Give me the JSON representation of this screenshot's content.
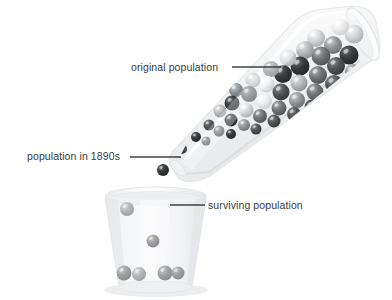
{
  "figure": {
    "kind": "illustration",
    "background_color": "#ffffff",
    "label_color": "#3a3a3c",
    "leader_line_color": "#3f3f41"
  },
  "labels": {
    "original_population": "original population",
    "population_1890s": "population in 1890s",
    "surviving_population": "surviving population"
  },
  "leaders": [
    {
      "name": "leader-original-population",
      "x1": 232,
      "y1": 67,
      "x2": 281,
      "y2": 67
    },
    {
      "name": "leader-population-1890s",
      "x1": 130,
      "y1": 157,
      "x2": 181,
      "y2": 157
    },
    {
      "name": "leader-surviving-population",
      "x1": 170,
      "y1": 205,
      "x2": 205,
      "y2": 205
    }
  ],
  "tube": {
    "name": "tilted-test-tube",
    "fill": "#f4f5f6",
    "stroke": "#e2e4e6",
    "rim_highlight": "#ffffff"
  },
  "cup": {
    "name": "beaker-cup",
    "fill": "#f3f4f5",
    "stroke": "#e6e8ea",
    "rim": "#fafbfb"
  },
  "marble_palette": {
    "very_light": "#e8e9ea",
    "light": "#cdcfd1",
    "mid_light": "#aeb1b4",
    "mid": "#8d9093",
    "mid_dark": "#6e7174",
    "dark": "#4d5053",
    "very_dark": "#34373a"
  },
  "marbles_in_tube": [
    {
      "cx": 354,
      "cy": 34,
      "r": 9.5,
      "tone": "light"
    },
    {
      "cx": 340,
      "cy": 27,
      "r": 8.5,
      "tone": "very_light"
    },
    {
      "cx": 333,
      "cy": 45,
      "r": 9.0,
      "tone": "mid"
    },
    {
      "cx": 349,
      "cy": 55,
      "r": 9.5,
      "tone": "very_dark"
    },
    {
      "cx": 316,
      "cy": 38,
      "r": 9.0,
      "tone": "light"
    },
    {
      "cx": 321,
      "cy": 56,
      "r": 9.5,
      "tone": "mid_dark"
    },
    {
      "cx": 336,
      "cy": 66,
      "r": 9.0,
      "tone": "dark"
    },
    {
      "cx": 353,
      "cy": 72,
      "r": 8.0,
      "tone": "mid"
    },
    {
      "cx": 305,
      "cy": 50,
      "r": 9.0,
      "tone": "mid_light"
    },
    {
      "cx": 300,
      "cy": 66,
      "r": 9.5,
      "tone": "very_dark"
    },
    {
      "cx": 318,
      "cy": 75,
      "r": 9.0,
      "tone": "mid_dark"
    },
    {
      "cx": 334,
      "cy": 84,
      "r": 9.0,
      "tone": "dark"
    },
    {
      "cx": 349,
      "cy": 89,
      "r": 7.5,
      "tone": "mid"
    },
    {
      "cx": 288,
      "cy": 58,
      "r": 8.5,
      "tone": "light"
    },
    {
      "cx": 283,
      "cy": 74,
      "r": 9.0,
      "tone": "very_dark"
    },
    {
      "cx": 299,
      "cy": 83,
      "r": 8.5,
      "tone": "mid_light"
    },
    {
      "cx": 315,
      "cy": 92,
      "r": 8.5,
      "tone": "mid_dark"
    },
    {
      "cx": 330,
      "cy": 100,
      "r": 8.0,
      "tone": "dark"
    },
    {
      "cx": 271,
      "cy": 69,
      "r": 8.0,
      "tone": "mid"
    },
    {
      "cx": 266,
      "cy": 84,
      "r": 8.5,
      "tone": "very_light"
    },
    {
      "cx": 281,
      "cy": 92,
      "r": 8.5,
      "tone": "dark"
    },
    {
      "cx": 297,
      "cy": 100,
      "r": 8.0,
      "tone": "mid"
    },
    {
      "cx": 312,
      "cy": 107,
      "r": 7.5,
      "tone": "very_dark"
    },
    {
      "cx": 253,
      "cy": 80,
      "r": 7.5,
      "tone": "light"
    },
    {
      "cx": 249,
      "cy": 94,
      "r": 8.0,
      "tone": "mid_dark"
    },
    {
      "cx": 264,
      "cy": 101,
      "r": 8.0,
      "tone": "very_light"
    },
    {
      "cx": 279,
      "cy": 108,
      "r": 7.5,
      "tone": "mid_dark"
    },
    {
      "cx": 294,
      "cy": 114,
      "r": 7.0,
      "tone": "dark"
    },
    {
      "cx": 236,
      "cy": 90,
      "r": 7.0,
      "tone": "mid"
    },
    {
      "cx": 232,
      "cy": 103,
      "r": 7.5,
      "tone": "very_dark"
    },
    {
      "cx": 246,
      "cy": 110,
      "r": 7.5,
      "tone": "light"
    },
    {
      "cx": 260,
      "cy": 116,
      "r": 7.0,
      "tone": "mid_dark"
    },
    {
      "cx": 274,
      "cy": 121,
      "r": 6.5,
      "tone": "dark"
    },
    {
      "cx": 220,
      "cy": 111,
      "r": 6.5,
      "tone": "mid_light"
    },
    {
      "cx": 231,
      "cy": 120,
      "r": 6.5,
      "tone": "very_dark"
    },
    {
      "cx": 244,
      "cy": 125,
      "r": 6.0,
      "tone": "mid"
    },
    {
      "cx": 256,
      "cy": 129,
      "r": 5.5,
      "tone": "dark"
    },
    {
      "cx": 209,
      "cy": 125,
      "r": 5.5,
      "tone": "dark"
    },
    {
      "cx": 219,
      "cy": 131,
      "r": 5.5,
      "tone": "mid_dark"
    },
    {
      "cx": 231,
      "cy": 134,
      "r": 5.0,
      "tone": "very_dark"
    },
    {
      "cx": 196,
      "cy": 137,
      "r": 5.0,
      "tone": "very_dark"
    },
    {
      "cx": 206,
      "cy": 141,
      "r": 4.5,
      "tone": "mid_dark"
    },
    {
      "cx": 182,
      "cy": 149,
      "r": 5.0,
      "tone": "dark"
    }
  ],
  "marbles_falling": [
    {
      "cx": 163,
      "cy": 170,
      "r": 6.0,
      "tone": "very_dark"
    }
  ],
  "marbles_in_cup": [
    {
      "cx": 127,
      "cy": 209,
      "r": 7.0,
      "tone": "mid"
    },
    {
      "cx": 153,
      "cy": 241,
      "r": 6.5,
      "tone": "mid_dark"
    },
    {
      "cx": 124,
      "cy": 273,
      "r": 7.5,
      "tone": "mid_dark"
    },
    {
      "cx": 139,
      "cy": 274,
      "r": 7.0,
      "tone": "mid"
    },
    {
      "cx": 165,
      "cy": 273,
      "r": 7.5,
      "tone": "mid_dark"
    },
    {
      "cx": 178,
      "cy": 273,
      "r": 6.5,
      "tone": "mid_dark"
    }
  ],
  "counts": {
    "marbles_in_tube": 43,
    "marbles_falling": 1,
    "marbles_in_cup": 6
  }
}
